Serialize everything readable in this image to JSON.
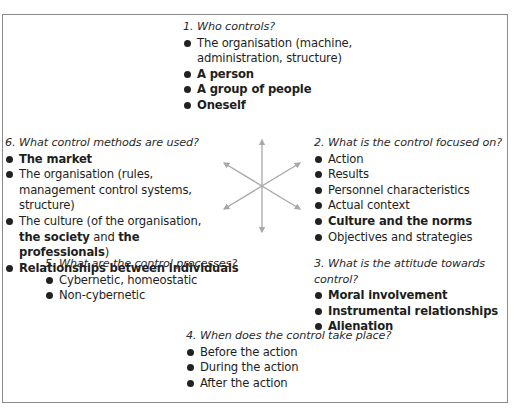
{
  "diagram": {
    "center_arrows": {
      "count": 6,
      "color": "#a8a8a8",
      "directions": [
        "up",
        "upper-right",
        "lower-right",
        "down",
        "lower-left",
        "upper-left"
      ]
    },
    "blocks": {
      "q1": {
        "heading": "1. Who controls?",
        "items": [
          {
            "parts": [
              {
                "text": "The organisation (machine, administration, structure)",
                "bold": false
              }
            ]
          },
          {
            "parts": [
              {
                "text": "A person",
                "bold": true
              }
            ]
          },
          {
            "parts": [
              {
                "text": "A group of people",
                "bold": true
              }
            ]
          },
          {
            "parts": [
              {
                "text": "Oneself",
                "bold": true
              }
            ]
          }
        ]
      },
      "q2": {
        "heading": "2. What is the control focused on?",
        "items": [
          {
            "parts": [
              {
                "text": "Action",
                "bold": false
              }
            ]
          },
          {
            "parts": [
              {
                "text": "Results",
                "bold": false
              }
            ]
          },
          {
            "parts": [
              {
                "text": "Personnel characteristics",
                "bold": false
              }
            ]
          },
          {
            "parts": [
              {
                "text": "Actual context",
                "bold": false
              }
            ]
          },
          {
            "parts": [
              {
                "text": "Culture and the norms",
                "bold": true
              }
            ]
          },
          {
            "parts": [
              {
                "text": "Objectives and strategies",
                "bold": false
              }
            ]
          }
        ]
      },
      "q3": {
        "heading": "3. What is the attitude towards control?",
        "items": [
          {
            "parts": [
              {
                "text": "Moral involvement",
                "bold": true
              }
            ]
          },
          {
            "parts": [
              {
                "text": "Instrumental relationships",
                "bold": true
              }
            ]
          },
          {
            "parts": [
              {
                "text": "Alienation",
                "bold": true
              }
            ]
          }
        ]
      },
      "q4": {
        "heading": "4. When does the control take place?",
        "items": [
          {
            "parts": [
              {
                "text": "Before the action",
                "bold": false
              }
            ]
          },
          {
            "parts": [
              {
                "text": "During the action",
                "bold": false
              }
            ]
          },
          {
            "parts": [
              {
                "text": "After the action",
                "bold": false
              }
            ]
          }
        ]
      },
      "q5": {
        "heading": "5. What are the control processes?",
        "items": [
          {
            "parts": [
              {
                "text": "Cybernetic, homeostatic",
                "bold": false
              }
            ]
          },
          {
            "parts": [
              {
                "text": "Non-cybernetic",
                "bold": false
              }
            ]
          }
        ]
      },
      "q6": {
        "heading": "6. What control methods are used?",
        "items": [
          {
            "parts": [
              {
                "text": "The market",
                "bold": true
              }
            ]
          },
          {
            "parts": [
              {
                "text": "The organisation (rules, management control systems, structure)",
                "bold": false
              }
            ]
          },
          {
            "parts": [
              {
                "text": "The culture (of the organisation, ",
                "bold": false
              },
              {
                "text": "the society",
                "bold": true
              },
              {
                "text": " and ",
                "bold": false
              },
              {
                "text": "the professionals",
                "bold": true
              },
              {
                "text": ")",
                "bold": false
              }
            ]
          },
          {
            "parts": [
              {
                "text": "Relationships between individuals",
                "bold": true
              }
            ]
          }
        ]
      }
    }
  }
}
